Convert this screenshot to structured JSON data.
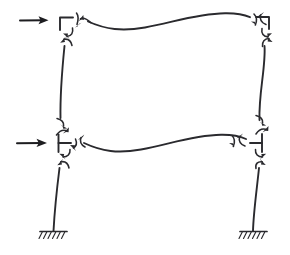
{
  "figure": {
    "kind": "hand-drawn structural engineering sketch",
    "background_color": "#ffffff",
    "ink_color": "#2a2a2e",
    "width": 290,
    "height": 255
  },
  "loads": [
    {
      "id": "lateral-load-upper",
      "label": "",
      "direction": "right",
      "applied_at_joint": "joint-upper-left",
      "shaft_start": [
        20,
        20
      ],
      "shaft_end": [
        47,
        20
      ]
    },
    {
      "id": "lateral-load-lower",
      "label": "",
      "direction": "right",
      "applied_at_joint": "joint-lower-left",
      "shaft_start": [
        17,
        143
      ],
      "shaft_end": [
        46,
        143
      ]
    }
  ],
  "joints": [
    {
      "id": "joint-upper-left",
      "label": "",
      "x": 66,
      "y": 22,
      "moment_arrows": 4
    },
    {
      "id": "joint-upper-right",
      "label": "",
      "x": 262,
      "y": 22,
      "moment_arrows": 4
    },
    {
      "id": "joint-lower-left",
      "label": "",
      "x": 62,
      "y": 143,
      "moment_arrows": 4
    },
    {
      "id": "joint-lower-right",
      "label": "",
      "x": 258,
      "y": 143,
      "moment_arrows": 4
    }
  ],
  "members": [
    {
      "id": "beam-upper",
      "label": "",
      "type": "beam",
      "deflection": "double-curvature S-shape",
      "from": "joint-upper-left",
      "to": "joint-upper-right"
    },
    {
      "id": "beam-lower",
      "label": "",
      "type": "beam",
      "deflection": "double-curvature S-shape",
      "from": "joint-lower-left",
      "to": "joint-lower-right"
    },
    {
      "id": "column-upper-left",
      "label": "",
      "type": "column",
      "deflection": "bowed",
      "from": "joint-upper-left",
      "to": "joint-lower-left"
    },
    {
      "id": "column-upper-right",
      "label": "",
      "type": "column",
      "deflection": "bowed",
      "from": "joint-upper-right",
      "to": "joint-lower-right"
    },
    {
      "id": "column-lower-left",
      "label": "",
      "type": "column",
      "deflection": "bowed",
      "from": "joint-lower-left",
      "to": "support-left"
    },
    {
      "id": "column-lower-right",
      "label": "",
      "type": "column",
      "deflection": "bowed",
      "from": "joint-lower-right",
      "to": "support-right"
    }
  ],
  "supports": [
    {
      "id": "support-left",
      "label": "",
      "type": "fixed",
      "x": 53,
      "y": 232,
      "hatch_count": 6
    },
    {
      "id": "support-right",
      "label": "",
      "type": "fixed",
      "x": 253,
      "y": 232,
      "hatch_count": 6
    }
  ],
  "annotations": []
}
